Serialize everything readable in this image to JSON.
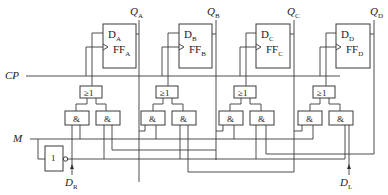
{
  "diagram": {
    "type": "4-bit bidirectional shift register (logic circuit)",
    "flip_flops": [
      {
        "id": "A",
        "d_label": "D",
        "d_sub": "A",
        "ff_label": "FF",
        "ff_sub": "A",
        "q_label": "Q",
        "q_sub": "A"
      },
      {
        "id": "B",
        "d_label": "D",
        "d_sub": "B",
        "ff_label": "FF",
        "ff_sub": "B",
        "q_label": "Q",
        "q_sub": "B"
      },
      {
        "id": "C",
        "d_label": "D",
        "d_sub": "C",
        "ff_label": "FF",
        "ff_sub": "C",
        "q_label": "Q",
        "q_sub": "C"
      },
      {
        "id": "D",
        "d_label": "D",
        "d_sub": "D",
        "ff_label": "FF",
        "ff_sub": "D",
        "q_label": "Q",
        "q_sub": "D"
      }
    ],
    "or_gate_label": "≥1",
    "and_gate_label": "&",
    "inverter_label": "1",
    "signals": {
      "clock": "CP",
      "mode": "M",
      "right_input": {
        "main": "D",
        "sub": "R"
      },
      "left_input": {
        "main": "D",
        "sub": "L"
      }
    }
  }
}
